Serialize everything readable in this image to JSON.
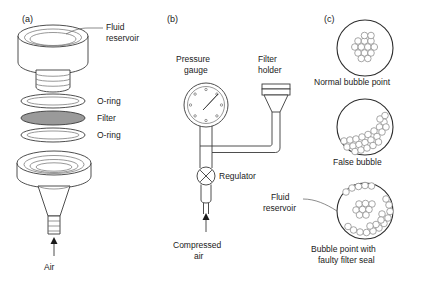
{
  "figure": {
    "panels": [
      {
        "id": "a",
        "label": "(a)",
        "name": "filter-holder-exploded-assembly",
        "annotations": [
          {
            "key": "fluid_reservoir",
            "text_line1": "Fluid",
            "text_line2": "reservoir"
          },
          {
            "key": "oring_top",
            "text": "O-ring"
          },
          {
            "key": "filter",
            "text": "Filter"
          },
          {
            "key": "oring_bottom",
            "text": "O-ring"
          },
          {
            "key": "air",
            "text": "Air"
          }
        ]
      },
      {
        "id": "b",
        "label": "(b)",
        "name": "bubble-point-test-apparatus",
        "annotations": [
          {
            "key": "pressure_gauge",
            "text_line1": "Pressure",
            "text_line2": "gauge"
          },
          {
            "key": "filter_holder",
            "text_line1": "Filter",
            "text_line2": "holder"
          },
          {
            "key": "regulator",
            "text": "Regulator"
          },
          {
            "key": "compressed_air",
            "text_line1": "Compressed",
            "text_line2": "air"
          }
        ]
      },
      {
        "id": "c",
        "label": "(c)",
        "name": "bubble-pattern-observations",
        "views": [
          {
            "key": "normal",
            "caption_line1": "Normal bubble point",
            "caption_line2": ""
          },
          {
            "key": "false",
            "caption_line1": "False bubble",
            "caption_line2": ""
          },
          {
            "key": "faulty",
            "caption_line1": "Bubble point with",
            "caption_line2": "faulty filter seal"
          }
        ],
        "annotations": [
          {
            "key": "fluid_reservoir",
            "text_line1": "Fluid",
            "text_line2": "reservoir"
          }
        ]
      }
    ],
    "colors": {
      "line": "#3a3a3a",
      "bubble_stroke": "#8a8a8a",
      "filter_fill": "#9a9a9a",
      "background": "#ffffff"
    }
  }
}
